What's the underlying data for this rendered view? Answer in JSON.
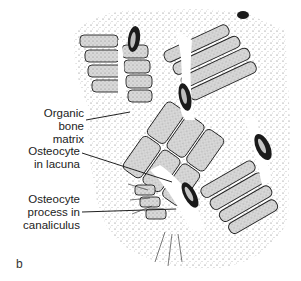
{
  "figure": {
    "panel_letter": "b",
    "labels": [
      {
        "id": "organic-bone-matrix",
        "line1": "Organic",
        "line2": "bone matrix"
      },
      {
        "id": "osteocyte-in-lacuna",
        "line1": "Osteocyte",
        "line2": "in lacuna"
      },
      {
        "id": "osteocyte-process",
        "line1": "Osteocyte",
        "line2": "process in",
        "line3": "canaliculus"
      }
    ],
    "colors": {
      "ink": "#1a1a1a",
      "stipple": "#555555",
      "background": "#ffffff",
      "cell_fill": "#c8c8c8"
    }
  }
}
